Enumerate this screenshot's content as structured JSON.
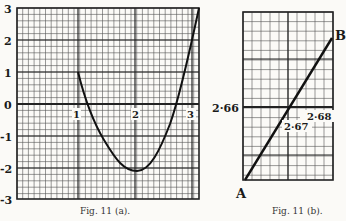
{
  "chart_data": [
    {
      "type": "line",
      "title": "",
      "caption": "Fig. 11 (a).",
      "xlabel": "",
      "ylabel": "",
      "x_ticks": [
        "1",
        "2",
        "3"
      ],
      "y_ticks": [
        "3",
        "2",
        "1",
        "0",
        "-1",
        "-2",
        "-3"
      ],
      "xlim": [
        0,
        3.2
      ],
      "ylim": [
        -3,
        3
      ],
      "grid": true,
      "series": [
        {
          "name": "curve",
          "x": [
            1.0,
            1.15,
            1.3,
            1.5,
            1.7,
            1.9,
            2.0,
            2.1,
            2.3,
            2.5,
            2.75,
            2.9,
            3.0,
            3.15
          ],
          "y": [
            1.0,
            0.0,
            -0.8,
            -1.5,
            -1.95,
            -2.15,
            -2.15,
            -2.05,
            -1.6,
            -0.9,
            0.0,
            1.0,
            1.8,
            3.0
          ]
        }
      ]
    },
    {
      "type": "line",
      "title": "",
      "caption": "Fig. 11 (b).",
      "point_labels": [
        "A",
        "B"
      ],
      "axis_label": "2·66",
      "annotations": [
        "2·67",
        "2·68"
      ],
      "grid": true,
      "series": [
        {
          "name": "AB",
          "x": [
            0,
            1
          ],
          "y": [
            0,
            1
          ]
        }
      ]
    }
  ],
  "fig_a": {
    "y_labels": [
      "3",
      "2",
      "1",
      "0",
      "-1",
      "-2",
      "-3"
    ],
    "x_labels": [
      "1",
      "2",
      "3"
    ],
    "caption": "Fig. 11 (a)."
  },
  "fig_b": {
    "label_a": "A",
    "label_b": "B",
    "axis_value": "2·66",
    "value_mid": "2·67",
    "value_right": "2·68",
    "caption": "Fig. 11 (b)."
  }
}
